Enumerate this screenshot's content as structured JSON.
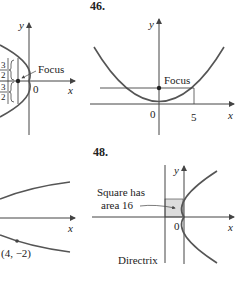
{
  "problems": [
    {
      "number": "",
      "panel": "top-left",
      "labels": {
        "y_axis": "y",
        "x_axis": "x",
        "origin": "0",
        "focus": "Focus",
        "upper_half": "3/2",
        "lower_half": "3/2",
        "frac_num": "3",
        "frac_den": "2"
      }
    },
    {
      "number": "46.",
      "panel": "top-right",
      "labels": {
        "y_axis": "y",
        "x_axis": "x",
        "origin": "0",
        "focus": "Focus",
        "x_tick": "5"
      }
    },
    {
      "number": "",
      "panel": "bottom-left",
      "labels": {
        "x_axis": "x",
        "point": "(4, −2)"
      }
    },
    {
      "number": "48.",
      "panel": "bottom-right",
      "labels": {
        "y_axis": "y",
        "x_axis": "x",
        "origin": "0",
        "square_line1": "Square has",
        "square_line2": "area 16",
        "directrix": "Directrix"
      }
    }
  ],
  "colors": {
    "curve": "#555555",
    "axis": "#444444",
    "text": "#222222",
    "shade": "#dcdcdc"
  }
}
